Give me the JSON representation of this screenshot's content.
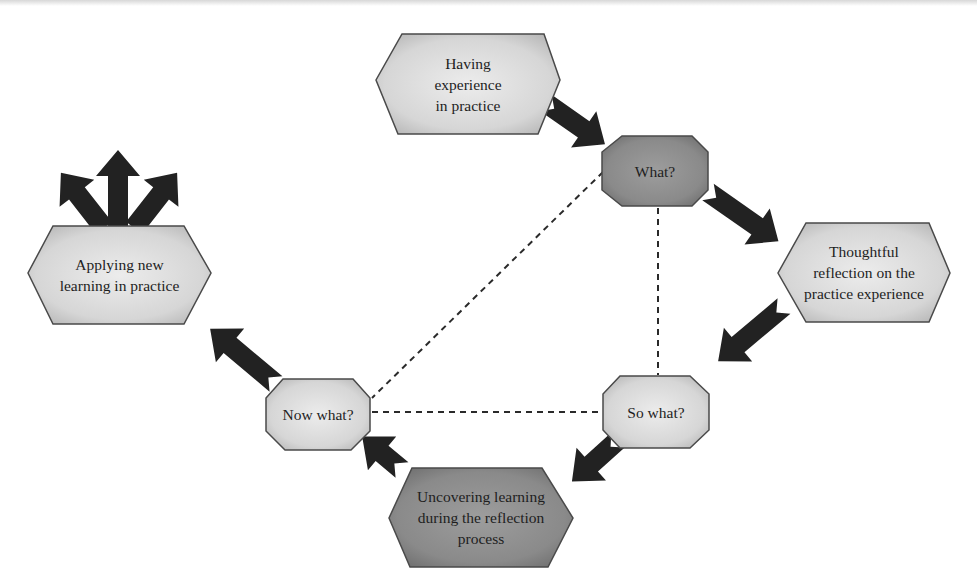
{
  "figure": {
    "colors": {
      "node_light": "#d9d9d9",
      "node_dark": "#8c8c8c",
      "node_stroke": "#4a4a4a",
      "arrow": "#222222",
      "dashed_line": "#2a2a2a"
    }
  },
  "nodes": {
    "having_experience": {
      "label": "Having\nexperience\nin practice",
      "shape": "hexagon",
      "tone": "light"
    },
    "what": {
      "label": "What?",
      "shape": "octagon",
      "tone": "dark"
    },
    "thoughtful_reflection": {
      "label": "Thoughtful\nreflection on the\npractice experience",
      "shape": "hexagon",
      "tone": "light"
    },
    "so_what": {
      "label": "So what?",
      "shape": "octagon",
      "tone": "light"
    },
    "uncovering_learning": {
      "label": "Uncovering learning\nduring the reflection\nprocess",
      "shape": "hexagon",
      "tone": "dark"
    },
    "now_what": {
      "label": "Now what?",
      "shape": "octagon",
      "tone": "light"
    },
    "applying_learning": {
      "label": "Applying new\nlearning in practice",
      "shape": "hexagon",
      "tone": "light"
    }
  },
  "edges": [
    {
      "from": "having_experience",
      "to": "what",
      "style": "block-arrow"
    },
    {
      "from": "what",
      "to": "thoughtful_reflection",
      "style": "block-arrow"
    },
    {
      "from": "thoughtful_reflection",
      "to": "so_what",
      "style": "block-arrow"
    },
    {
      "from": "so_what",
      "to": "uncovering_learning",
      "style": "block-arrow"
    },
    {
      "from": "uncovering_learning",
      "to": "now_what",
      "style": "block-arrow"
    },
    {
      "from": "now_what",
      "to": "applying_learning",
      "style": "block-arrow"
    },
    {
      "from": "applying_learning",
      "to": "outward-left",
      "style": "block-arrow"
    },
    {
      "from": "applying_learning",
      "to": "outward-up",
      "style": "block-arrow"
    },
    {
      "from": "applying_learning",
      "to": "outward-right",
      "style": "block-arrow"
    },
    {
      "from": "what",
      "to": "so_what",
      "style": "dashed"
    },
    {
      "from": "what",
      "to": "now_what",
      "style": "dashed"
    },
    {
      "from": "so_what",
      "to": "now_what",
      "style": "dashed"
    }
  ]
}
